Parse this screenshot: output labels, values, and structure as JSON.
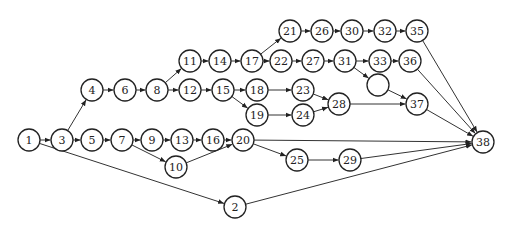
{
  "diagram": {
    "type": "activity-on-node network",
    "node_radius": 11,
    "colors": {
      "stroke": "#222222",
      "fill": "#ffffff",
      "edge": "#333333"
    },
    "nodes": [
      {
        "id": "1",
        "label": "1",
        "x": 29,
        "y": 140
      },
      {
        "id": "3",
        "label": "3",
        "x": 62,
        "y": 140
      },
      {
        "id": "5",
        "label": "5",
        "x": 92,
        "y": 140
      },
      {
        "id": "7",
        "label": "7",
        "x": 122,
        "y": 140
      },
      {
        "id": "9",
        "label": "9",
        "x": 152,
        "y": 140
      },
      {
        "id": "13",
        "label": "13",
        "x": 182,
        "y": 140
      },
      {
        "id": "16",
        "label": "16",
        "x": 213,
        "y": 140
      },
      {
        "id": "20",
        "label": "20",
        "x": 243,
        "y": 140
      },
      {
        "id": "10",
        "label": "10",
        "x": 176,
        "y": 167
      },
      {
        "id": "2",
        "label": "2",
        "x": 235,
        "y": 207
      },
      {
        "id": "4",
        "label": "4",
        "x": 92,
        "y": 90
      },
      {
        "id": "6",
        "label": "6",
        "x": 125,
        "y": 90
      },
      {
        "id": "8",
        "label": "8",
        "x": 157,
        "y": 90
      },
      {
        "id": "11",
        "label": "11",
        "x": 190,
        "y": 61
      },
      {
        "id": "14",
        "label": "14",
        "x": 220,
        "y": 61
      },
      {
        "id": "17",
        "label": "17",
        "x": 252,
        "y": 61
      },
      {
        "id": "12",
        "label": "12",
        "x": 190,
        "y": 90
      },
      {
        "id": "15",
        "label": "15",
        "x": 223,
        "y": 90
      },
      {
        "id": "18",
        "label": "18",
        "x": 257,
        "y": 90
      },
      {
        "id": "19",
        "label": "19",
        "x": 257,
        "y": 115
      },
      {
        "id": "23",
        "label": "23",
        "x": 303,
        "y": 90
      },
      {
        "id": "24",
        "label": "24",
        "x": 303,
        "y": 115
      },
      {
        "id": "28",
        "label": "28",
        "x": 339,
        "y": 104
      },
      {
        "id": "21",
        "label": "21",
        "x": 290,
        "y": 31
      },
      {
        "id": "26",
        "label": "26",
        "x": 322,
        "y": 31
      },
      {
        "id": "30",
        "label": "30",
        "x": 352,
        "y": 31
      },
      {
        "id": "32",
        "label": "32",
        "x": 385,
        "y": 31
      },
      {
        "id": "35",
        "label": "35",
        "x": 417,
        "y": 31
      },
      {
        "id": "22",
        "label": "22",
        "x": 281,
        "y": 61
      },
      {
        "id": "27",
        "label": "27",
        "x": 313,
        "y": 61
      },
      {
        "id": "31",
        "label": "31",
        "x": 345,
        "y": 61
      },
      {
        "id": "33",
        "label": "33",
        "x": 380,
        "y": 61
      },
      {
        "id": "36",
        "label": "36",
        "x": 410,
        "y": 61
      },
      {
        "id": "blank",
        "label": "",
        "x": 378,
        "y": 85
      },
      {
        "id": "37",
        "label": "37",
        "x": 417,
        "y": 104
      },
      {
        "id": "25",
        "label": "25",
        "x": 297,
        "y": 160
      },
      {
        "id": "29",
        "label": "29",
        "x": 350,
        "y": 160
      },
      {
        "id": "38",
        "label": "38",
        "x": 483,
        "y": 142
      }
    ],
    "edges": [
      [
        "1",
        "3"
      ],
      [
        "3",
        "5"
      ],
      [
        "5",
        "7"
      ],
      [
        "7",
        "9"
      ],
      [
        "9",
        "13"
      ],
      [
        "13",
        "16"
      ],
      [
        "16",
        "20"
      ],
      [
        "7",
        "10"
      ],
      [
        "10",
        "20"
      ],
      [
        "1",
        "2"
      ],
      [
        "2",
        "38"
      ],
      [
        "3",
        "4"
      ],
      [
        "4",
        "6"
      ],
      [
        "6",
        "8"
      ],
      [
        "8",
        "11"
      ],
      [
        "8",
        "12"
      ],
      [
        "11",
        "14"
      ],
      [
        "14",
        "17"
      ],
      [
        "17",
        "21"
      ],
      [
        "17",
        "22"
      ],
      [
        "21",
        "26"
      ],
      [
        "26",
        "30"
      ],
      [
        "30",
        "32"
      ],
      [
        "32",
        "35"
      ],
      [
        "35",
        "38"
      ],
      [
        "22",
        "27"
      ],
      [
        "27",
        "31"
      ],
      [
        "31",
        "33"
      ],
      [
        "33",
        "36"
      ],
      [
        "36",
        "38"
      ],
      [
        "31",
        "blank"
      ],
      [
        "blank",
        "37"
      ],
      [
        "12",
        "15"
      ],
      [
        "15",
        "18"
      ],
      [
        "15",
        "19"
      ],
      [
        "18",
        "23"
      ],
      [
        "19",
        "24"
      ],
      [
        "23",
        "28"
      ],
      [
        "24",
        "28"
      ],
      [
        "28",
        "37"
      ],
      [
        "37",
        "38"
      ],
      [
        "20",
        "38"
      ],
      [
        "20",
        "25"
      ],
      [
        "25",
        "29"
      ],
      [
        "29",
        "38"
      ]
    ]
  }
}
